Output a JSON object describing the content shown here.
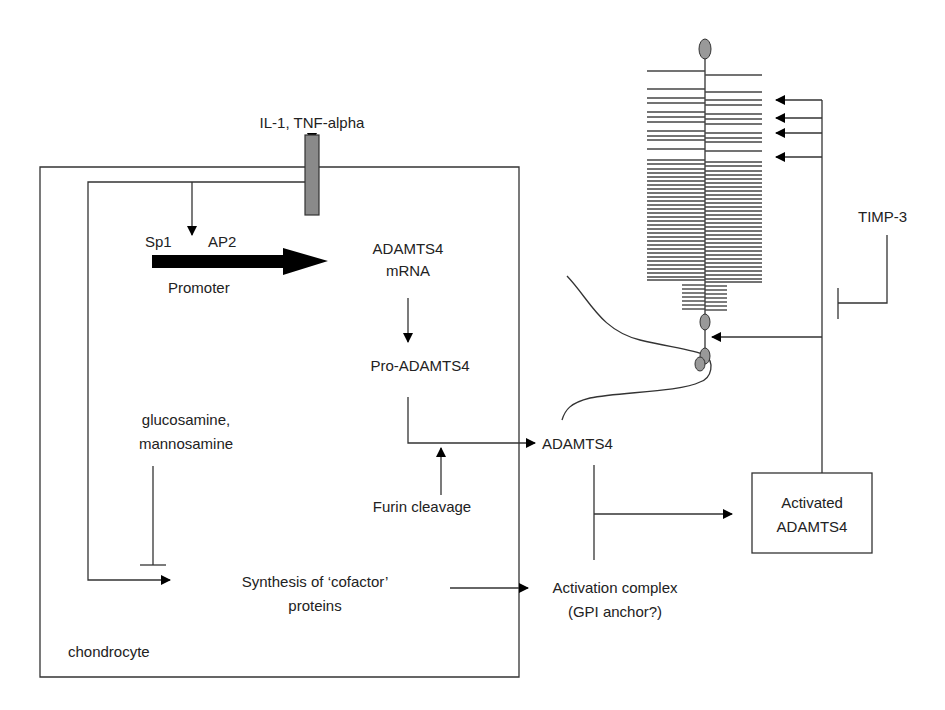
{
  "colors": {
    "line": "#333333",
    "receptor_fill": "#8a8a8a",
    "node_fill": "#999999",
    "arrow": "#000000"
  },
  "labels": {
    "stimulus": "IL-1, TNF-alpha",
    "sp1": "Sp1",
    "ap2": "AP2",
    "promoter": "Promoter",
    "mrna_line1": "ADAMTS4",
    "mrna_line2": "mRNA",
    "pro_adamts4": "Pro-ADAMTS4",
    "inhibitor_line1": "glucosamine,",
    "inhibitor_line2": "mannosamine",
    "furin": "Furin cleavage",
    "synthesis_line1": "Synthesis of ‘cofactor’",
    "synthesis_line2": "proteins",
    "cell": "chondrocyte",
    "adamts4": "ADAMTS4",
    "complex_line1": "Activation complex",
    "complex_line2": "(GPI anchor?)",
    "activated_line1": "Activated",
    "activated_line2": "ADAMTS4",
    "timp3": "TIMP-3"
  },
  "icons": {
    "receptor": "receptor-bar-icon",
    "promoter_arrow": "thick-arrow-icon",
    "aggrecan": "aggrecan-bottlebrush-icon",
    "inhibition": "t-bar-inhibit-icon"
  }
}
